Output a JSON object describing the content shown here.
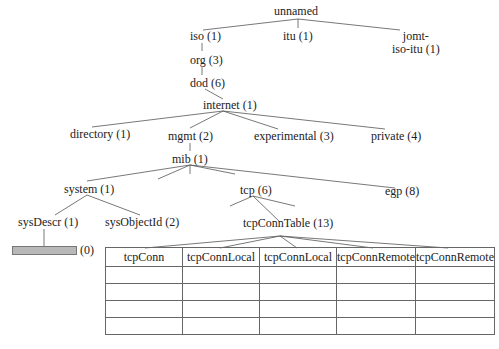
{
  "tree": {
    "root": "unnamed",
    "nodes": {
      "iso": "iso (1)",
      "itu": "itu (1)",
      "joint": "jomt-",
      "joint2": "iso-itu (1)",
      "org": "org (3)",
      "dod": "dod (6)",
      "internet": "internet (1)",
      "directory": "directory (1)",
      "mgmt": "mgmt (2)",
      "experimental": "experimental (3)",
      "private": "private (4)",
      "mib": "mib (1)",
      "system": "system (1)",
      "tcp": "tcp (6)",
      "egp": "egp (8)",
      "sysDescr": "sysDescr (1)",
      "sysObjectId": "sysObjectId (2)",
      "tcpConnTable": "tcpConnTable (13)"
    },
    "scalar_instance_label": "(0)"
  },
  "table": {
    "headers": [
      "tcpConn",
      "tcpConnLocal",
      "tcpConnLocal",
      "tcpConnRemote",
      "tcpConnRemote"
    ],
    "rows": [
      [
        "",
        "",
        "",
        "",
        ""
      ],
      [
        "",
        "",
        "",
        "",
        ""
      ],
      [
        "",
        "",
        "",
        "",
        ""
      ],
      [
        "",
        "",
        "",
        "",
        ""
      ]
    ]
  }
}
